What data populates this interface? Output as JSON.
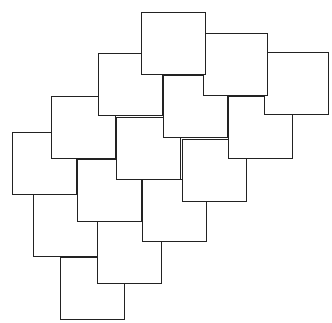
{
  "diagram": {
    "type": "overlapping-squares-tessellation",
    "canvas": {
      "width": 332,
      "height": 323,
      "background": "#ffffff"
    },
    "stroke_color": "#222222",
    "fill_color": "#ffffff",
    "square_size": {
      "width": 65,
      "height": 63
    },
    "stacking_rule": "higher squares (smaller top y) drawn on top",
    "squares": [
      {
        "id": "sq-1",
        "x": 141,
        "y": 12
      },
      {
        "id": "sq-2",
        "x": 203,
        "y": 33
      },
      {
        "id": "sq-3",
        "x": 264,
        "y": 52
      },
      {
        "id": "sq-4",
        "x": 98,
        "y": 53
      },
      {
        "id": "sq-5",
        "x": 163,
        "y": 75
      },
      {
        "id": "sq-6",
        "x": 228,
        "y": 96
      },
      {
        "id": "sq-7",
        "x": 51,
        "y": 96
      },
      {
        "id": "sq-8",
        "x": 116,
        "y": 117
      },
      {
        "id": "sq-9",
        "x": 12,
        "y": 132
      },
      {
        "id": "sq-10",
        "x": 182,
        "y": 139
      },
      {
        "id": "sq-11",
        "x": 77,
        "y": 159
      },
      {
        "id": "sq-12",
        "x": 142,
        "y": 179
      },
      {
        "id": "sq-13",
        "x": 33,
        "y": 194
      },
      {
        "id": "sq-14",
        "x": 97,
        "y": 221
      },
      {
        "id": "sq-15",
        "x": 60,
        "y": 257
      }
    ]
  }
}
